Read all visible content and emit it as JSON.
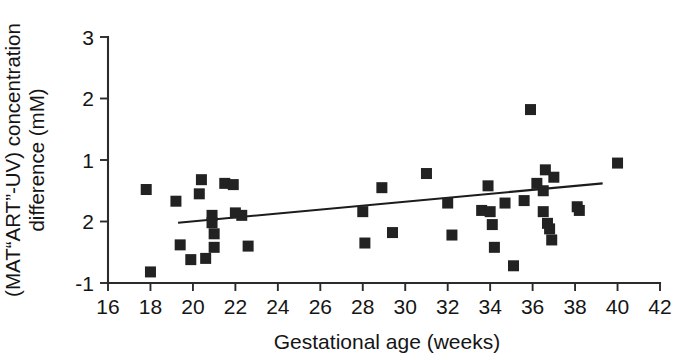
{
  "chart_data": {
    "type": "scatter",
    "title": "",
    "xlabel": "Gestational age (weeks)",
    "ylabel": "(MAT“ART”-UV) concentration difference (mM)",
    "ylabel_line1": "(MAT“ART”-UV) concentration",
    "ylabel_line2": "difference (mM)",
    "xlim": [
      16,
      42
    ],
    "ylim": [
      -1,
      3
    ],
    "xticks": [
      16,
      18,
      20,
      22,
      24,
      26,
      28,
      30,
      32,
      34,
      36,
      38,
      40,
      42
    ],
    "xtick_labels": [
      "16",
      "18",
      "20",
      "22",
      "24",
      "26",
      "28",
      "30",
      "32",
      "34",
      "36",
      "38",
      "40",
      "42"
    ],
    "yticks": [
      3,
      2,
      1,
      0,
      -1
    ],
    "ytick_labels": [
      "3",
      "2",
      "1",
      "2",
      "-1"
    ],
    "grid": false,
    "legend": null,
    "marker": "filled-square",
    "marker_color": "#222222",
    "points": [
      {
        "x": 17.8,
        "y": 0.52
      },
      {
        "x": 18.0,
        "y": -0.82
      },
      {
        "x": 19.2,
        "y": 0.33
      },
      {
        "x": 19.4,
        "y": -0.38
      },
      {
        "x": 19.9,
        "y": -0.62
      },
      {
        "x": 20.3,
        "y": 0.45
      },
      {
        "x": 20.4,
        "y": 0.68
      },
      {
        "x": 20.6,
        "y": -0.6
      },
      {
        "x": 20.9,
        "y": 0.1
      },
      {
        "x": 20.9,
        "y": -0.02
      },
      {
        "x": 21.0,
        "y": -0.2
      },
      {
        "x": 21.0,
        "y": -0.42
      },
      {
        "x": 21.5,
        "y": 0.62
      },
      {
        "x": 21.9,
        "y": 0.6
      },
      {
        "x": 22.0,
        "y": 0.14
      },
      {
        "x": 22.3,
        "y": 0.1
      },
      {
        "x": 22.6,
        "y": -0.4
      },
      {
        "x": 28.0,
        "y": 0.16
      },
      {
        "x": 28.1,
        "y": -0.35
      },
      {
        "x": 28.9,
        "y": 0.55
      },
      {
        "x": 29.4,
        "y": -0.18
      },
      {
        "x": 31.0,
        "y": 0.78
      },
      {
        "x": 32.0,
        "y": 0.3
      },
      {
        "x": 32.2,
        "y": -0.22
      },
      {
        "x": 33.6,
        "y": 0.18
      },
      {
        "x": 33.9,
        "y": 0.58
      },
      {
        "x": 34.0,
        "y": 0.16
      },
      {
        "x": 34.1,
        "y": -0.05
      },
      {
        "x": 34.2,
        "y": -0.42
      },
      {
        "x": 34.7,
        "y": 0.3
      },
      {
        "x": 35.1,
        "y": -0.72
      },
      {
        "x": 35.6,
        "y": 0.34
      },
      {
        "x": 35.9,
        "y": 1.82
      },
      {
        "x": 36.2,
        "y": 0.62
      },
      {
        "x": 36.5,
        "y": 0.5
      },
      {
        "x": 36.5,
        "y": 0.16
      },
      {
        "x": 36.6,
        "y": 0.84
      },
      {
        "x": 36.7,
        "y": -0.03
      },
      {
        "x": 36.8,
        "y": -0.12
      },
      {
        "x": 36.9,
        "y": -0.3
      },
      {
        "x": 37.0,
        "y": 0.72
      },
      {
        "x": 38.1,
        "y": 0.24
      },
      {
        "x": 38.2,
        "y": 0.18
      },
      {
        "x": 40.0,
        "y": 0.95
      }
    ],
    "trend_line": {
      "x_start": 19.3,
      "y_start": -0.02,
      "x_end": 39.3,
      "y_end": 0.62
    }
  }
}
